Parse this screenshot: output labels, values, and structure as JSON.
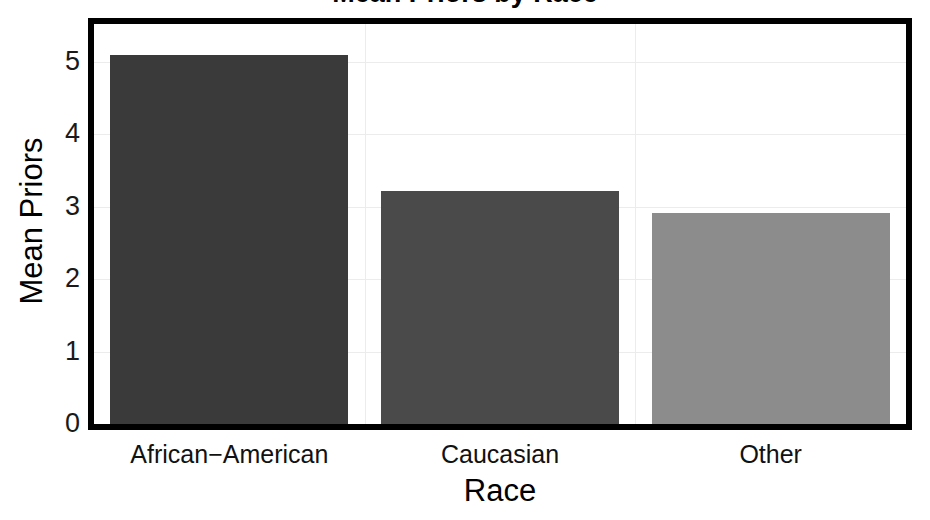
{
  "chart_data": {
    "type": "bar",
    "title": "Mean Priors by Race",
    "xlabel": "Race",
    "ylabel": "Mean Priors",
    "categories": [
      "African−American",
      "Caucasian",
      "Other"
    ],
    "values": [
      5.09,
      3.22,
      2.91
    ],
    "series": [
      {
        "name": "Mean Priors",
        "values": [
          5.09,
          3.22,
          2.91
        ]
      }
    ],
    "bar_colors": [
      "#3a3a3a",
      "#4a4a4a",
      "#8c8c8c"
    ],
    "ylim": [
      0,
      5.52
    ],
    "ytick_labels": [
      "0",
      "1",
      "2",
      "3",
      "4",
      "5"
    ],
    "ytick_values": [
      0,
      1,
      2,
      3,
      4,
      5
    ],
    "grid": true,
    "grid_color": "#ececec",
    "legend": "none",
    "frame_color": "#000000",
    "background": "#ffffff"
  },
  "axes": {
    "y_axis_title": "Mean Priors",
    "x_axis_title": "Race"
  }
}
